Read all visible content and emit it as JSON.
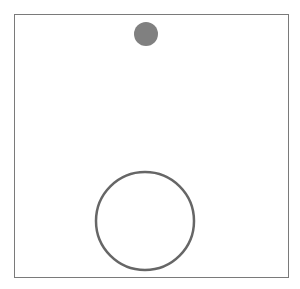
{
  "diagram": {
    "frame": {
      "x": 14,
      "y": 14,
      "width": 275,
      "height": 264,
      "stroke": "#7a7a7a"
    },
    "shapes": [
      {
        "name": "small-filled-circle",
        "cx": 146,
        "cy": 34,
        "r": 12,
        "fill": "#808080",
        "stroke": "none"
      },
      {
        "name": "large-outline-circle",
        "cx": 145,
        "cy": 221,
        "r": 49,
        "fill": "none",
        "stroke": "#666666",
        "stroke_width": 2.5
      }
    ]
  }
}
